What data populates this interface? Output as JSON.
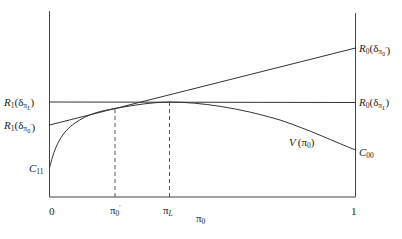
{
  "diagram": {
    "type": "value-function-plot",
    "x_axis": {
      "label": "π0",
      "ticks": [
        {
          "label": "0",
          "pos": 0
        },
        {
          "label": "π0'",
          "pos": 0.215
        },
        {
          "label": "πL",
          "pos": 0.392
        },
        {
          "label": "1",
          "pos": 1
        }
      ]
    },
    "left_labels": {
      "r1_pi_l": {
        "main": "R",
        "sub": "1",
        "paren": "(δ",
        "pi_sub": "π",
        "pi_subsub": "L",
        "close": ")"
      },
      "r1_pi0p": {
        "main": "R",
        "sub": "1",
        "paren": "(δ",
        "pi_sub": "π",
        "pi_subsub": "0",
        "prime": "′",
        "close": ")"
      },
      "c11": {
        "main": "C",
        "sub": "11"
      }
    },
    "right_labels": {
      "r0_pi0p": {
        "main": "R",
        "sub": "0",
        "paren": "(δ",
        "pi_sub": "π",
        "pi_subsub": "0",
        "prime": "′",
        "close": ")"
      },
      "r0_pi_l": {
        "main": "R",
        "sub": "0",
        "paren": "(δ",
        "pi_sub": "π",
        "pi_subsub": "L",
        "close": ")"
      },
      "c00": {
        "main": "C",
        "sub": "00"
      }
    },
    "curve_label": {
      "main": "V",
      "paren": "(π",
      "sub": "0",
      "close": ")"
    },
    "tick_labels": {
      "zero": "0",
      "pi0p_main": "π",
      "pi0p_sub": "0",
      "pi0p_prime": "′",
      "pil_main": "π",
      "pil_sub": "L",
      "one": "1"
    },
    "axis_title": {
      "main": "π",
      "sub": "0"
    },
    "lines": {
      "horizontal_R_piL": {
        "y_left": 102,
        "y_right": 102
      },
      "tangent_R_pi0p": {
        "y_left": 125,
        "y_right": 48
      }
    },
    "colors": {
      "stroke": "#333333",
      "background": "#ffffff"
    }
  }
}
